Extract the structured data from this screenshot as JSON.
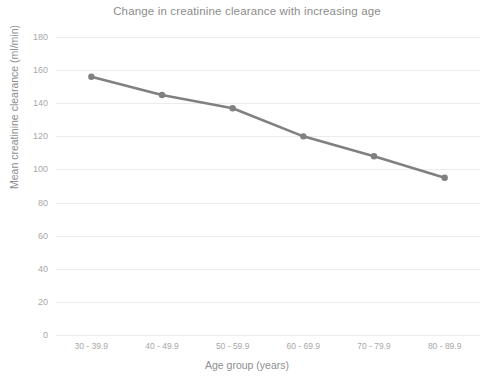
{
  "chart_data": {
    "type": "line",
    "title": "Change in creatinine clearance with increasing age",
    "xlabel": "Age group (years)",
    "ylabel": "Mean creatinine clearance (ml/min)",
    "categories": [
      "30 - 39.9",
      "40 - 49.9",
      "50 - 59.9",
      "60 - 69.9",
      "70 - 79.9",
      "80 - 89.9"
    ],
    "values": [
      156,
      145,
      137,
      120,
      108,
      95
    ],
    "series": [
      {
        "name": "Mean creatinine clearance",
        "values": [
          156,
          145,
          137,
          120,
          108,
          95
        ]
      }
    ],
    "ylim": [
      0,
      180
    ],
    "yticks": [
      0,
      20,
      40,
      60,
      80,
      100,
      120,
      140,
      160,
      180
    ],
    "ytick_labels": [
      "0",
      "20",
      "40",
      "60",
      "80",
      "100",
      "120",
      "140",
      "160",
      "180"
    ],
    "grid": true,
    "grid_axis": "y",
    "legend": false,
    "legend_position": "none",
    "line_color": "#808080",
    "marker_color": "#808080",
    "marker": "circle",
    "grid_color": "#ebebeb",
    "background_color": "#ffffff",
    "text_color": "#8c8c8c"
  }
}
